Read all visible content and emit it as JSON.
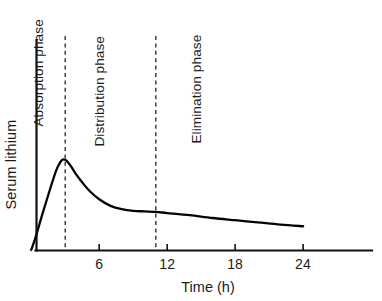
{
  "chart_data": {
    "type": "line",
    "title": "",
    "subtitle": "",
    "xlabel": "Time (h)",
    "ylabel": "Serum lithium",
    "xlim": [
      0,
      30
    ],
    "ylim": [
      0,
      1.05
    ],
    "grid": false,
    "legend_position": "none",
    "x_ticks": [
      6,
      12,
      18,
      24
    ],
    "x_tick_labels": [
      "6",
      "12",
      "18",
      "24"
    ],
    "y_ticks": [],
    "y_tick_labels": [],
    "series": [
      {
        "name": "Serum lithium concentration",
        "x": [
          0,
          0.4,
          1.0,
          1.6,
          2.2,
          2.6,
          2.8,
          3.0,
          3.2,
          3.5,
          4.0,
          4.6,
          5.2,
          6.0,
          7.0,
          8.0,
          9.0,
          10.0,
          11.0,
          12.0,
          14.0,
          16.0,
          18.0,
          20.0,
          22.0,
          24.0
        ],
        "y": [
          0.0,
          0.12,
          0.33,
          0.53,
          0.72,
          0.8,
          0.82,
          0.818,
          0.8,
          0.76,
          0.68,
          0.6,
          0.53,
          0.46,
          0.4,
          0.37,
          0.355,
          0.35,
          0.345,
          0.335,
          0.315,
          0.29,
          0.27,
          0.25,
          0.23,
          0.215
        ]
      }
    ],
    "annotations": [
      {
        "id": "absorption",
        "label": "Absorption phase",
        "x_range": [
          0,
          3.0
        ],
        "orientation": "vertical"
      },
      {
        "id": "distribution",
        "label": "Distribution phase",
        "x_range": [
          3.0,
          11.0
        ],
        "orientation": "vertical"
      },
      {
        "id": "elimination",
        "label": "Elimination phase",
        "x_range": [
          11.0,
          30
        ],
        "orientation": "vertical"
      }
    ],
    "phase_dividers": [
      {
        "id": "absorption-distribution-divider",
        "x": 3.0,
        "style": "dashed"
      },
      {
        "id": "distribution-elimination-divider",
        "x": 11.0,
        "style": "dashed"
      }
    ],
    "colors": {
      "background": "#ffffff",
      "curve": "#050505",
      "axis": "#101010",
      "divider": "#1a1a1a",
      "text": "#1a1a1a"
    }
  },
  "labels": {
    "y_axis_title": "Serum lithium",
    "x_axis_title": "Time (h)",
    "phase_absorption": "Absorption phase",
    "phase_distribution": "Distribution phase",
    "phase_elimination": "Elimination phase",
    "tick_6": "6",
    "tick_12": "12",
    "tick_18": "18",
    "tick_24": "24"
  }
}
